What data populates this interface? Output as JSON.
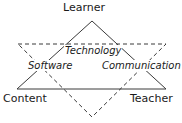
{
  "diagram": {
    "colors": {
      "line": "#3a3a3a",
      "text": "#1a1a1a",
      "background": "#ffffff"
    },
    "vertices": [
      {
        "id": "learner",
        "label": "Learner"
      },
      {
        "id": "content",
        "label": "Content"
      },
      {
        "id": "teacher",
        "label": "Teacher"
      }
    ],
    "regions": [
      {
        "id": "technology",
        "label": "Technology"
      },
      {
        "id": "software",
        "label": "Software"
      },
      {
        "id": "communication",
        "label": "Communication"
      }
    ],
    "shapes": {
      "solid_triangle": {
        "style": "solid",
        "points": "92,21 17,89 166,89"
      },
      "dashed_triangle": {
        "style": "dashed",
        "points": "18,44 166,44 92,117"
      }
    }
  }
}
